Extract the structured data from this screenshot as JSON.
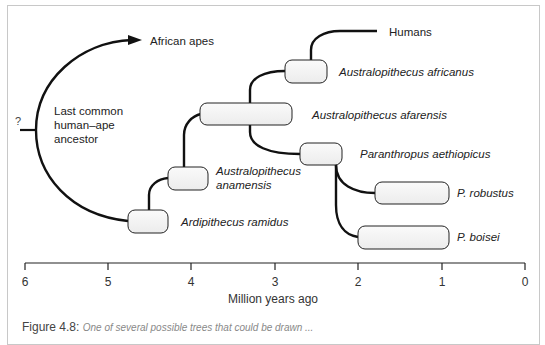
{
  "diagram": {
    "root_marker": "?",
    "ancestor_label": [
      "Last common",
      "human–ape",
      "ancestor"
    ],
    "apes_label": "African apes",
    "humans_label": "Humans",
    "species": [
      {
        "name": "Ardipithecus ramidus",
        "italic": true
      },
      {
        "name": "Australopithecus anamensis",
        "lines": [
          "Australopithecus",
          "anamensis"
        ],
        "italic": true
      },
      {
        "name": "Australopithecus afarensis",
        "italic": true
      },
      {
        "name": "Australopithecus africanus",
        "italic": true
      },
      {
        "name": "Paranthropus aethiopicus",
        "italic": true
      },
      {
        "name": "P. robustus",
        "italic": true
      },
      {
        "name": "P. boisei",
        "italic": true
      }
    ],
    "axis": {
      "title": "Million years ago",
      "ticks": [
        "6",
        "5",
        "4",
        "3",
        "2",
        "1",
        "0"
      ]
    },
    "caption": {
      "figure_number": "Figure 4.8:",
      "text": "One of several possible trees that could be drawn ..."
    },
    "colors": {
      "line": "#111111",
      "box_fill": "#f2f2f2",
      "box_stroke": "#222222",
      "frame": "#c8c8c8"
    }
  }
}
